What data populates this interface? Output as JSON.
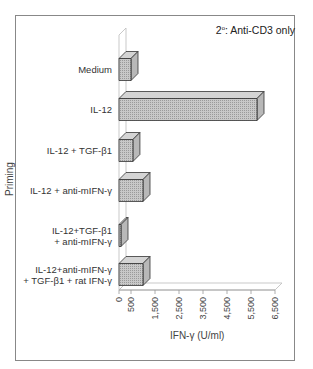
{
  "chart_data": {
    "type": "bar",
    "orientation": "horizontal",
    "style": "3d",
    "title_parts": {
      "main": "2",
      "sup": "o",
      "rest": ": Anti-CD3 only"
    },
    "ylabel": "Priming",
    "xlabel": "IFN-γ (U/ml)",
    "categories": [
      "Medium",
      "IL-12",
      "IL-12 + TGF-β1",
      "IL-12 + anti-mIFN-γ",
      "IL-12+TGF-β1 + anti-mIFN-γ",
      "IL-12+anti-mIFN-γ + TGF-β1 + rat IFN-γ"
    ],
    "category_lines": [
      [
        "Medium"
      ],
      [
        "IL-12"
      ],
      [
        "IL-12 + TGF-β1"
      ],
      [
        "IL-12 + anti-mIFN-γ"
      ],
      [
        "IL-12+TGF-β1",
        "+ anti-mIFN-γ"
      ],
      [
        "IL-12+anti-mIFN-γ",
        "+ TGF-β1 + rat IFN-γ"
      ]
    ],
    "values": [
      500,
      5750,
      580,
      1000,
      50,
      1000
    ],
    "xticks": [
      "0",
      "500",
      "1,500",
      "2,500",
      "3,500",
      "4,500",
      "5,500",
      "6,500"
    ],
    "xtick_values": [
      0,
      500,
      1500,
      2500,
      3500,
      4500,
      5500,
      6500
    ],
    "xlim": [
      0,
      6500
    ],
    "grid": false,
    "legend": null,
    "bar_color": "#c8c8c8"
  }
}
